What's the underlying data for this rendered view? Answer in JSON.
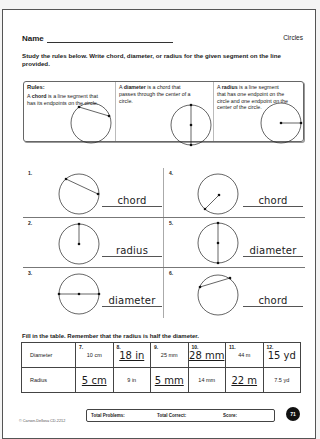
{
  "header": {
    "name_label": "Name",
    "topic": "Circles"
  },
  "instructions": "Study the rules below. Write chord, diameter, or radius for the given segment on the line provided.",
  "rules": {
    "title": "Rules:",
    "chord": {
      "prefix": "A ",
      "term": "chord",
      "text": " is a line segment that has its endpoints on the circle."
    },
    "diameter": {
      "prefix": "A ",
      "term": "diameter",
      "text": " is a chord that passes through the center of a circle."
    },
    "radius": {
      "prefix": "A ",
      "term": "radius",
      "text": " is a line segment that has one endpoint on the circle and one endpoint on the center of the circle."
    }
  },
  "problems": [
    {
      "number": "1.",
      "segment": "chord",
      "answer": "chord"
    },
    {
      "number": "2.",
      "segment": "radius",
      "answer": "radius"
    },
    {
      "number": "3.",
      "segment": "diameter",
      "answer": "diameter"
    },
    {
      "number": "4.",
      "segment": "radius",
      "answer": "chord"
    },
    {
      "number": "5.",
      "segment": "diameter",
      "answer": "diameter"
    },
    {
      "number": "6.",
      "segment": "chord",
      "answer": "chord"
    }
  ],
  "table_instructions": "Fill in the table. Remember that the radius is half the diameter.",
  "table": {
    "row_labels": [
      "Diameter",
      "Radius"
    ],
    "columns": [
      {
        "number": "7.",
        "diameter": "10 cm",
        "radius": "5 cm",
        "handwritten": "radius"
      },
      {
        "number": "8.",
        "diameter": "18 in",
        "radius": "9 in",
        "handwritten": "diameter"
      },
      {
        "number": "9.",
        "diameter": "25 mm",
        "radius": "5 mm",
        "handwritten": "radius"
      },
      {
        "number": "10.",
        "diameter": "28 mm",
        "radius": "14 mm",
        "handwritten": "diameter"
      },
      {
        "number": "11.",
        "diameter": "44 m",
        "radius": "22 m",
        "handwritten": "radius"
      },
      {
        "number": "12.",
        "diameter": "15 yd",
        "radius": "7.5 yd",
        "handwritten": "diameter"
      }
    ]
  },
  "footer": {
    "copyright": "© Carson-Dellosa CD-2212",
    "total_problems_label": "Total Problems:",
    "total_correct_label": "Total Correct:",
    "score_label": "Score:",
    "page_number": "71"
  }
}
